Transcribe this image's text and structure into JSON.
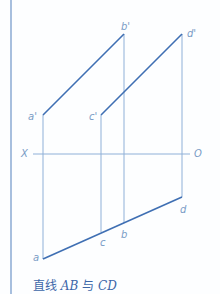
{
  "diagram": {
    "caption_prefix": "直线",
    "caption_ab": "AB",
    "caption_mid": "与",
    "caption_cd": "CD",
    "axis": {
      "left_label": "X",
      "right_label": "O"
    },
    "points": {
      "a_prime": "a'",
      "b_prime": "b'",
      "c_prime": "c'",
      "d_prime": "d'",
      "a": "a",
      "b": "b",
      "c": "c",
      "d": "d"
    },
    "colors": {
      "line": "#3f6fb3",
      "thin": "#7aa0d0",
      "text": "#7a9cc6"
    }
  }
}
